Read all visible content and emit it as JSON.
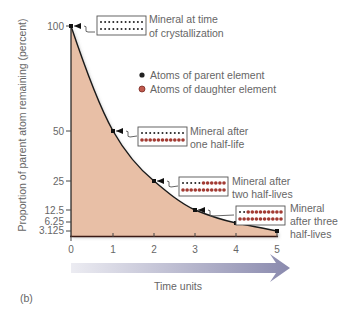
{
  "panel_label": "(b)",
  "colors": {
    "fill": "#e6bca4",
    "curve": "#1a1a1a",
    "parent_atom": "#222222",
    "daughter_atom": "#8b2a2a",
    "arrow_start": "#e6e6ee",
    "arrow_end": "#8e8eb0",
    "text": "#666666"
  },
  "legend": {
    "items": [
      {
        "label": "Atoms of parent element",
        "color": "#222222"
      },
      {
        "label": "Atoms of daughter element",
        "color": "#b04a40"
      }
    ]
  },
  "annotations": [
    {
      "line1": "Mineral at time",
      "line2": "of crystallization",
      "line3": "",
      "parent_atoms_row1": 11,
      "parent_atoms_row2": 11
    },
    {
      "line1": "Mineral after",
      "line2": "one half-life",
      "line3": "",
      "parent_atoms_row1": 11,
      "parent_atoms_row2": 0
    },
    {
      "line1": "Mineral after",
      "line2": "two half-lives",
      "line3": "",
      "parent_atoms_row1": 5,
      "parent_atoms_row2": 0
    },
    {
      "line1": "Mineral",
      "line2": "after three",
      "line3": "half-lives",
      "parent_atoms_row1": 2,
      "parent_atoms_row2": 0
    }
  ],
  "chart_data": {
    "type": "area",
    "title": "",
    "xlabel": "Time units",
    "ylabel": "Proportion of parent atom remaining (percent)",
    "x": [
      0,
      1,
      2,
      3,
      4,
      5
    ],
    "series": [
      {
        "name": "Parent atoms remaining (%)",
        "values": [
          100,
          50,
          25,
          12.5,
          6.25,
          3.125
        ]
      }
    ],
    "x_ticks": [
      "0",
      "1",
      "2",
      "3",
      "4",
      "5"
    ],
    "y_ticks": [
      "100",
      "50",
      "25",
      "12.5",
      "6.25",
      "3.125"
    ],
    "xlim": [
      0,
      5
    ],
    "ylim": [
      0,
      100
    ],
    "grid": false,
    "legend_position": "upper right",
    "annotations": [
      {
        "x": 0,
        "y": 100,
        "text": "Mineral at time of crystallization"
      },
      {
        "x": 1,
        "y": 50,
        "text": "Mineral after one half-life"
      },
      {
        "x": 2,
        "y": 25,
        "text": "Mineral after two half-lives"
      },
      {
        "x": 3,
        "y": 12.5,
        "text": "Mineral after three half-lives"
      }
    ]
  }
}
